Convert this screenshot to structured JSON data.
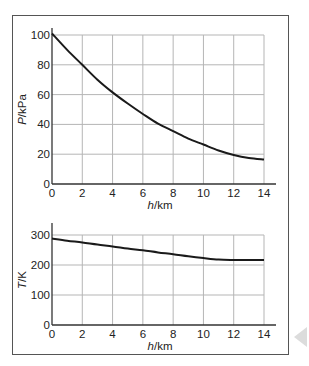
{
  "chart_data": [
    {
      "type": "line",
      "title": "",
      "xlabel": "h/km",
      "ylabel": "P/kPa",
      "xlim": [
        0,
        14
      ],
      "ylim": [
        0,
        100
      ],
      "x_ticks": [
        0,
        2,
        4,
        6,
        8,
        10,
        12,
        14
      ],
      "y_ticks": [
        0,
        20,
        40,
        60,
        80,
        100
      ],
      "grid": true,
      "series": [
        {
          "name": "Pressure",
          "x": [
            0,
            1,
            2,
            3,
            4,
            5,
            6,
            7,
            8,
            9,
            10,
            11,
            12,
            13,
            14
          ],
          "values": [
            101,
            90,
            80,
            70,
            61.5,
            54,
            47,
            40.5,
            35.5,
            30.5,
            26.5,
            22.5,
            19.5,
            17.5,
            16.5
          ]
        }
      ]
    },
    {
      "type": "line",
      "title": "",
      "xlabel": "h/km",
      "ylabel": "T/K",
      "xlim": [
        0,
        14
      ],
      "ylim": [
        0,
        300
      ],
      "x_ticks": [
        0,
        2,
        4,
        6,
        8,
        10,
        12,
        14
      ],
      "y_ticks": [
        0,
        100,
        200,
        300
      ],
      "grid": true,
      "series": [
        {
          "name": "Temperature",
          "x": [
            0,
            1,
            2,
            3,
            4,
            5,
            6,
            7,
            8,
            9,
            10,
            11,
            12,
            13,
            14
          ],
          "values": [
            288,
            281,
            275,
            268,
            262,
            255,
            249,
            242,
            236,
            229,
            223,
            218,
            217,
            217,
            217
          ]
        }
      ]
    }
  ]
}
